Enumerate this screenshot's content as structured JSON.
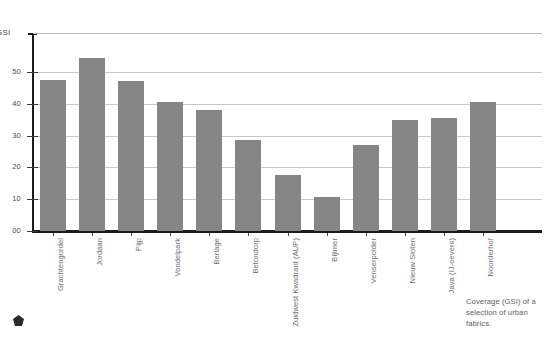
{
  "chart_data": {
    "type": "bar",
    "title": "",
    "xlabel": "",
    "ylabel": "GSI",
    "ylim": [
      0,
      57
    ],
    "grid": true,
    "legend": null,
    "bar_color": "#858585",
    "gridline_color": "#c9c9c9",
    "categories": [
      "Grachtengordel",
      "Jordaan",
      "Pijp",
      "Vondelpark",
      "Berlage",
      "Betondorp",
      "Zuidwest Kwadrant (AUP)",
      "Bijlmer",
      "Venserpolder",
      "Nieuw Sloten",
      "Java (IJ-oevers)",
      "Noorderhof"
    ],
    "values": [
      47.5,
      54.5,
      47.3,
      40.5,
      38.0,
      28.5,
      17.5,
      10.8,
      27.0,
      34.8,
      35.5,
      40.5
    ],
    "yticks": [
      0,
      10,
      20,
      30,
      40,
      50
    ],
    "ytick_labels": [
      "00",
      "10",
      "20",
      "30",
      "40",
      "50"
    ]
  },
  "caption": {
    "text": "Coverage (GSI) of a selection of urban fabrics."
  },
  "marks": {
    "corner_icon": "pentagon-mark-icon"
  }
}
